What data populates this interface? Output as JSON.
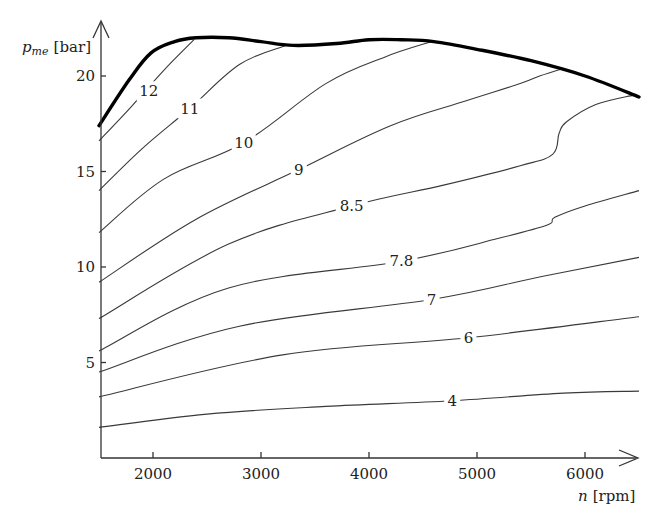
{
  "chart_data": {
    "type": "line",
    "subtype": "contour",
    "title": "",
    "xlabel": "n [rpm]",
    "xlabel_var": "n",
    "xlabel_unit": "[rpm]",
    "ylabel": "p_me [bar]",
    "ylabel_var": "p",
    "ylabel_sub": "me",
    "ylabel_unit": "[bar]",
    "xlim": [
      1500,
      6500
    ],
    "ylim": [
      0,
      22.5
    ],
    "x_ticks": [
      2000,
      3000,
      4000,
      5000,
      6000
    ],
    "x_tick_labels": [
      "2000",
      "3000",
      "4000",
      "5000",
      "6000"
    ],
    "y_ticks": [
      5,
      10,
      15,
      20
    ],
    "y_tick_labels": [
      "5",
      "10",
      "15",
      "20"
    ],
    "grid": false,
    "legend": "none",
    "boundary": {
      "name": "full-load curve",
      "points": [
        [
          1500,
          17.4
        ],
        [
          1780,
          19.8
        ],
        [
          1980,
          21.2
        ],
        [
          2200,
          21.8
        ],
        [
          2400,
          22.0
        ],
        [
          2700,
          22.0
        ],
        [
          3000,
          21.8
        ],
        [
          3300,
          21.6
        ],
        [
          3700,
          21.7
        ],
        [
          4000,
          21.9
        ],
        [
          4300,
          21.9
        ],
        [
          4600,
          21.8
        ],
        [
          5000,
          21.4
        ],
        [
          5500,
          20.8
        ],
        [
          6000,
          20.0
        ],
        [
          6500,
          18.9
        ]
      ]
    },
    "series": [
      {
        "name": "12",
        "label": "12",
        "label_at": [
          1960,
          19.2
        ],
        "points": [
          [
            1500,
            16.6
          ],
          [
            1800,
            18.4
          ],
          [
            2100,
            20.3
          ],
          [
            2380,
            21.9
          ]
        ]
      },
      {
        "name": "11",
        "label": "11",
        "label_at": [
          2340,
          18.3
        ],
        "points": [
          [
            1500,
            14.0
          ],
          [
            1900,
            16.2
          ],
          [
            2340,
            18.3
          ],
          [
            2800,
            20.6
          ],
          [
            3230,
            21.6
          ]
        ]
      },
      {
        "name": "10",
        "label": "10",
        "label_at": [
          2840,
          16.5
        ],
        "points": [
          [
            1500,
            11.8
          ],
          [
            2100,
            14.6
          ],
          [
            2840,
            16.5
          ],
          [
            3600,
            19.6
          ],
          [
            4150,
            21.0
          ],
          [
            4580,
            21.8
          ]
        ]
      },
      {
        "name": "9",
        "label": "9",
        "label_at": [
          3350,
          15.1
        ],
        "points": [
          [
            1500,
            9.2
          ],
          [
            2400,
            12.5
          ],
          [
            3350,
            15.1
          ],
          [
            4200,
            17.4
          ],
          [
            4900,
            18.7
          ],
          [
            5400,
            19.6
          ],
          [
            5580,
            20.0
          ],
          [
            5800,
            20.4
          ]
        ]
      },
      {
        "name": "8.5",
        "label": "8.5",
        "label_at": [
          3840,
          13.2
        ],
        "points": [
          [
            1500,
            7.3
          ],
          [
            2700,
            11.2
          ],
          [
            3840,
            13.2
          ],
          [
            4700,
            14.3
          ],
          [
            5400,
            15.3
          ],
          [
            5700,
            15.9
          ],
          [
            5760,
            17.0
          ],
          [
            5830,
            17.6
          ],
          [
            6100,
            18.5
          ],
          [
            6450,
            19.0
          ]
        ]
      },
      {
        "name": "7.8",
        "label": "7.8",
        "label_at": [
          4300,
          10.3
        ],
        "points": [
          [
            1500,
            5.6
          ],
          [
            2700,
            8.9
          ],
          [
            4300,
            10.3
          ],
          [
            5200,
            11.5
          ],
          [
            5650,
            12.2
          ],
          [
            5720,
            12.6
          ],
          [
            6000,
            13.2
          ],
          [
            6500,
            14.0
          ]
        ]
      },
      {
        "name": "7",
        "label": "7",
        "label_at": [
          4580,
          8.3
        ],
        "points": [
          [
            1500,
            4.5
          ],
          [
            2800,
            6.9
          ],
          [
            4580,
            8.3
          ],
          [
            5600,
            9.5
          ],
          [
            6500,
            10.5
          ]
        ]
      },
      {
        "name": "6",
        "label": "6",
        "label_at": [
          4920,
          6.3
        ],
        "points": [
          [
            1500,
            3.2
          ],
          [
            3200,
            5.4
          ],
          [
            4920,
            6.3
          ],
          [
            6500,
            7.4
          ]
        ]
      },
      {
        "name": "4",
        "label": "4",
        "label_at": [
          4770,
          3.0
        ],
        "points": [
          [
            1500,
            1.6
          ],
          [
            2500,
            2.3
          ],
          [
            3600,
            2.7
          ],
          [
            4770,
            3.0
          ],
          [
            5800,
            3.4
          ],
          [
            6500,
            3.5
          ]
        ]
      }
    ]
  },
  "axes": {
    "x_label_var": "n",
    "x_label_unit": "[rpm]",
    "y_label_var": "p",
    "y_label_sub": "me",
    "y_label_unit": "[bar]"
  }
}
